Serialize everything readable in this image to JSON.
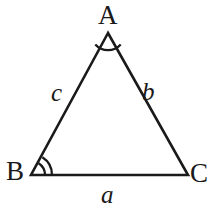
{
  "figure": {
    "kind": "geometry-diagram",
    "shape": "triangle",
    "background_color": "#ffffff",
    "stroke_color": "#1a1a1a",
    "stroke_width": 2.6,
    "width": 219,
    "height": 221
  },
  "vertices": [
    {
      "id": "A",
      "label": "A",
      "x": 108,
      "y": 33,
      "angle_marks": 1
    },
    {
      "id": "B",
      "label": "B",
      "x": 31,
      "y": 175,
      "angle_marks": 2
    },
    {
      "id": "C",
      "label": "C",
      "x": 188,
      "y": 175,
      "angle_marks": 0
    }
  ],
  "sides": [
    {
      "id": "a",
      "label": "a",
      "from": "B",
      "to": "C",
      "position": "below-base"
    },
    {
      "id": "b",
      "label": "b",
      "from": "A",
      "to": "C",
      "position": "right-inside"
    },
    {
      "id": "c",
      "label": "c",
      "from": "A",
      "to": "B",
      "position": "left-inside"
    }
  ],
  "geometry": {
    "path": "M 108 33 L 31 175 L 188 175 Z",
    "angle_arc_A": "M 95.3 44.4 A 17 17 0 0 0 120.7 44.4",
    "angle_arc_B_inner": "M 45 175 A 14 14 0 0 0 38.6 163.2",
    "angle_arc_B_outer": "M 52 175 A 21 21 0 0 0 42.4 157.3"
  }
}
